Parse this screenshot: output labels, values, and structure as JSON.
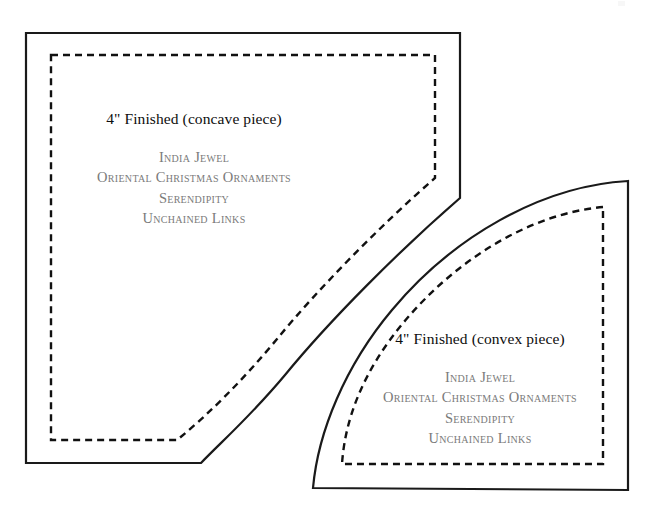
{
  "page": {
    "background_color": "#ffffff",
    "width": 654,
    "height": 517,
    "document_type": "quilt pattern template sheet"
  },
  "colors": {
    "outline_stroke": "#1a1a1a",
    "seamline_stroke": "#111111",
    "title_text": "#0d0d0d",
    "credit_text": "#7a7a7a"
  },
  "pieces": [
    {
      "id": "concave",
      "title": "4\" Finished (concave piece)",
      "credits": [
        "India Jewel",
        "Oriental Christmas Ornaments",
        "Serendipity",
        "Unchained Links"
      ]
    },
    {
      "id": "convex",
      "title": "4\" Finished (convex piece)",
      "credits": [
        "India Jewel",
        "Oriental Christmas Ornaments",
        "Serendipity",
        "Unchained Links"
      ]
    }
  ],
  "concave_piece": {
    "title": "4\" Finished (concave piece)",
    "credit_1": "India Jewel",
    "credit_2": "Oriental Christmas Ornaments",
    "credit_3": "Serendipity",
    "credit_4": "Unchained Links",
    "cut_line_path": "M 26 33 L 460 33 L 460 198 C 400 250 330 320 285 375 C 250 417 220 443 201 463 L 26 463 Z",
    "seam_line_path": "M 51 55 L 435 55 L 435 178 C 380 226 318 289 277 339 C 243 380 209 414 177 440 L 51 440 Z"
  },
  "convex_piece": {
    "title": "4\" Finished (convex piece)",
    "credit_1": "India Jewel",
    "credit_2": "Oriental Christmas Ornaments",
    "credit_3": "Serendipity",
    "credit_4": "Unchained Links",
    "cut_line_path": "M 628 181 C 540 186 452 238 392 310 C 345 366 318 432 313 488 L 628 490 Z",
    "seam_line_path": "M 603 207 C 528 214 455 261 404 322 C 363 371 345 419 342 464 L 603 464 Z"
  },
  "artifact": {
    "name": "page-scan-artifact"
  }
}
